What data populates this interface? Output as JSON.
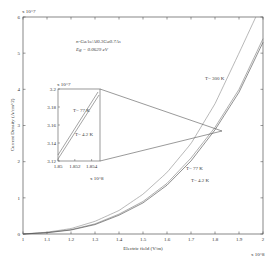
{
  "chart_data": {
    "type": "line",
    "title": "",
    "xlabel": "Electric field (V/m)",
    "ylabel": "Current Density (A/cm^2)",
    "x_multiplier": "x 10^8",
    "y_multiplier": "x 10^7",
    "xlim": [
      1,
      2
    ],
    "ylim": [
      0,
      6
    ],
    "x_ticks": [
      "1",
      "1.1",
      "1.2",
      "1.3",
      "1.4",
      "1.5",
      "1.6",
      "1.7",
      "1.8",
      "1.9",
      "2"
    ],
    "y_ticks": [
      "0",
      "1",
      "2",
      "3",
      "4",
      "5",
      "6"
    ],
    "grid": false,
    "annotation": {
      "line1": "n-GaAs/Al0.3Ga0.7As",
      "line2": "Eg = 0.0629 eV"
    },
    "series": [
      {
        "name": "T= 300 K",
        "x": [
          1.0,
          1.1,
          1.2,
          1.3,
          1.4,
          1.5,
          1.6,
          1.7,
          1.8,
          1.9,
          1.97
        ],
        "values": [
          0.0,
          0.05,
          0.15,
          0.35,
          0.65,
          1.1,
          1.7,
          2.5,
          3.6,
          5.0,
          6.0
        ]
      },
      {
        "name": "T= 77 K",
        "x": [
          1.0,
          1.1,
          1.2,
          1.3,
          1.4,
          1.5,
          1.6,
          1.7,
          1.8,
          1.9,
          2.0
        ],
        "values": [
          0.0,
          0.04,
          0.12,
          0.28,
          0.55,
          0.9,
          1.4,
          2.1,
          2.95,
          4.0,
          5.4
        ]
      },
      {
        "name": "T= 4.2 K",
        "x": [
          1.0,
          1.1,
          1.2,
          1.3,
          1.4,
          1.5,
          1.6,
          1.7,
          1.8,
          1.9,
          2.0
        ],
        "values": [
          0.0,
          0.035,
          0.11,
          0.26,
          0.52,
          0.86,
          1.35,
          2.02,
          2.88,
          3.92,
          5.3
        ]
      }
    ],
    "inset": {
      "xlim": [
        1.85,
        1.855
      ],
      "ylim": [
        3.12,
        3.2
      ],
      "x_ticks": [
        "1.85",
        "1.852",
        "1.854"
      ],
      "y_ticks": [
        "3.12",
        "3.14",
        "3.16",
        "3.18",
        "3.2"
      ],
      "x_multiplier": "x 10^8",
      "y_multiplier": "x 10^7",
      "series": [
        {
          "name": "T= 77 K",
          "x": [
            1.85,
            1.855
          ],
          "values": [
            3.125,
            3.2
          ]
        },
        {
          "name": "T= 4.2 K",
          "x": [
            1.85,
            1.855
          ],
          "values": [
            3.121,
            3.197
          ]
        }
      ],
      "labels": {
        "t77": "T= 77 K",
        "t42": "T= 4.2 K"
      }
    },
    "curve_labels": {
      "t300": "T= 300 K",
      "t77": "T= 77 K",
      "t42": "T= 4.2 K"
    }
  }
}
